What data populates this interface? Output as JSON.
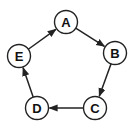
{
  "diagram": {
    "type": "directed-cycle-graph",
    "nodes": [
      {
        "id": "A",
        "label": "A",
        "x": 66,
        "y": 22
      },
      {
        "id": "B",
        "label": "B",
        "x": 115,
        "y": 53
      },
      {
        "id": "C",
        "label": "C",
        "x": 95,
        "y": 108
      },
      {
        "id": "D",
        "label": "D",
        "x": 37,
        "y": 108
      },
      {
        "id": "E",
        "label": "E",
        "x": 19,
        "y": 56
      }
    ],
    "edges": [
      {
        "from": "A",
        "to": "B"
      },
      {
        "from": "B",
        "to": "C"
      },
      {
        "from": "C",
        "to": "D"
      },
      {
        "from": "D",
        "to": "E"
      },
      {
        "from": "E",
        "to": "A"
      }
    ],
    "node_radius": 11.5,
    "stroke_color": "#222222"
  }
}
